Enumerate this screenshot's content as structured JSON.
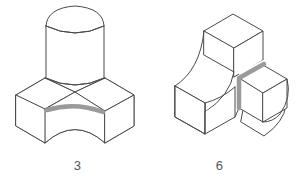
{
  "sheet": {
    "background_color": "#ffffff",
    "figure_count": 2
  },
  "style": {
    "line_color": "#4a4a4a",
    "line_width": 1.0,
    "highlight_color": "#9a9a9a",
    "highlight_width": 4.5,
    "face_fill": "#ffffff",
    "caption_color": "#555555"
  },
  "figures": [
    {
      "id": "figure-left",
      "caption": "3",
      "description": "isometric solid: square base block with concave cylindrical grooves on front and rear faces, topped by a vertical cylinder with a rounded top",
      "highlight": {
        "name": "front-groove-top-arc",
        "kind": "curved-edge",
        "color": "#9a9a9a"
      },
      "faces": [
        "top-left-base-face",
        "top-right-base-face",
        "front-left-base-face",
        "front-right-base-face",
        "concave-groove-face",
        "cylinder-body",
        "cylinder-rounded-top"
      ]
    },
    {
      "id": "figure-right",
      "caption": "6",
      "description": "isometric solid: L-shaped block with a concave fillet sweeping from the tall upper block down to the lower left block, plus a small cube at right with a rounded quarter-round rear corner",
      "highlight": {
        "name": "notch-edges",
        "kind": "straight-edges",
        "color": "#9a9a9a"
      },
      "faces": [
        "upper-block-top-face",
        "upper-block-front-face",
        "concave-fillet-face",
        "lower-left-top-face",
        "lower-left-front-face",
        "lower-left-side-face",
        "right-cube-top-face",
        "right-cube-front-face",
        "right-cube-side-face",
        "rounded-rear-corner"
      ]
    }
  ],
  "captions": {
    "left": "3",
    "right": "6"
  }
}
